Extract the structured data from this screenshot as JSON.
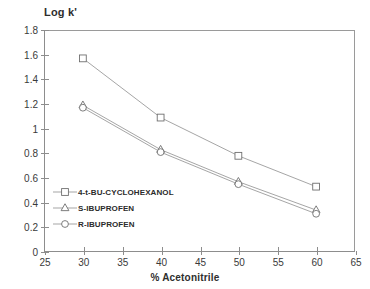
{
  "chart_data": {
    "type": "line",
    "title": "",
    "ylabel": "Log k'",
    "xlabel": "% Acetonitrile",
    "x": [
      30,
      40,
      50,
      60
    ],
    "xlim": [
      25,
      65
    ],
    "ylim": [
      0,
      1.8
    ],
    "xticks": [
      "25",
      "30",
      "35",
      "40",
      "45",
      "50",
      "55",
      "60",
      "65"
    ],
    "yticks": [
      "0",
      "0.2",
      "0.4",
      "0.6",
      "0.8",
      "1",
      "1.2",
      "1.4",
      "1.6",
      "1.8"
    ],
    "grid": false,
    "legend_position": "lower-left-inside",
    "series": [
      {
        "name": "4-t-BU-CYCLOHEXANOL",
        "marker": "square",
        "values": [
          1.57,
          1.09,
          0.78,
          0.53
        ]
      },
      {
        "name": "S-IBUPROFEN",
        "marker": "triangle",
        "values": [
          1.19,
          0.83,
          0.57,
          0.34
        ]
      },
      {
        "name": "R-IBUPROFEN",
        "marker": "circle",
        "values": [
          1.17,
          0.81,
          0.55,
          0.31
        ]
      }
    ],
    "colors": {
      "axis": "#8d8d8d",
      "line": "#9b9b9b",
      "marker_stroke": "#6f6f6f",
      "marker_fill": "#ffffff",
      "text": "#3a3a3a",
      "background": "#ffffff"
    }
  }
}
